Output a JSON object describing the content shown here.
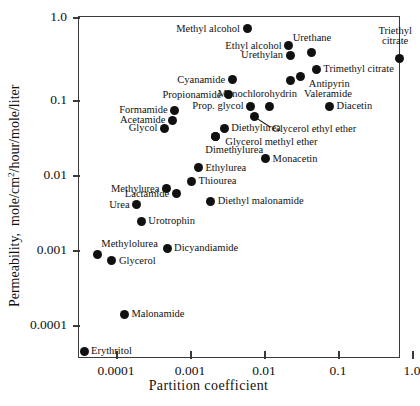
{
  "chart_data": {
    "type": "scatter",
    "title": "",
    "xlabel": "Partition coefficient",
    "ylabel": "Permeability, mole/cm2/hour/mole/liter",
    "ylabel_html": "Permeability,  mole/cm²/hour/mole/liter",
    "xscale": "log",
    "yscale": "log",
    "xlim": [
      3e-05,
      1.0
    ],
    "ylim": [
      4e-05,
      1.0
    ],
    "xticks": [
      "0.0001",
      "0.001",
      "0.01",
      "0.1",
      "1.0"
    ],
    "xtick_values": [
      0.0001,
      0.001,
      0.01,
      0.1,
      1.0
    ],
    "yticks": [
      "1.0",
      "0.1",
      "0.01",
      "0.001",
      "0.0001"
    ],
    "ytick_values": [
      1.0,
      0.1,
      0.01,
      0.001,
      0.0001
    ],
    "grid": false,
    "legend": "none",
    "marker": "filled-circle",
    "marker_color": "#111111",
    "points": [
      {
        "name": "Methyl alcohol",
        "x": 0.0059,
        "y": 0.72,
        "label_side": "left"
      },
      {
        "name": "Ethyl alcohol",
        "x": 0.0215,
        "y": 0.45,
        "label_side": "left"
      },
      {
        "name": "Urethane",
        "x": 0.0445,
        "y": 0.37,
        "label_side": "above"
      },
      {
        "name": "Urethylan",
        "x": 0.0225,
        "y": 0.345,
        "label_side": "left"
      },
      {
        "name": "Triethyl citrate",
        "x": 0.67,
        "y": 0.315,
        "label_side": "above"
      },
      {
        "name": "Trimethyl citrate",
        "x": 0.051,
        "y": 0.235,
        "label_side": "right"
      },
      {
        "name": "Antipyrin",
        "x": 0.0315,
        "y": 0.19,
        "label_side": "below"
      },
      {
        "name": "Valeramide",
        "x": 0.0225,
        "y": 0.172,
        "label_side": "below"
      },
      {
        "name": "Cyanamide",
        "x": 0.0037,
        "y": 0.175,
        "label_side": "left"
      },
      {
        "name": "Propionamide",
        "x": 0.0033,
        "y": 0.115,
        "label_side": "left"
      },
      {
        "name": "Prop. glycol",
        "x": 0.0066,
        "y": 0.083,
        "label_side": "left"
      },
      {
        "name": "Monochlorohydrin",
        "x": 0.0118,
        "y": 0.083,
        "label_side": "above"
      },
      {
        "name": "Diacetin",
        "x": 0.077,
        "y": 0.082,
        "label_side": "right"
      },
      {
        "name": "Formamide",
        "x": 0.00062,
        "y": 0.073,
        "label_side": "left"
      },
      {
        "name": "Acetamide",
        "x": 0.00058,
        "y": 0.054,
        "label_side": "left"
      },
      {
        "name": "Glycerol ethyl ether",
        "x": 0.0074,
        "y": 0.061,
        "label_side": "leader"
      },
      {
        "name": "Glycol",
        "x": 0.00045,
        "y": 0.042,
        "label_side": "left"
      },
      {
        "name": "Diethylurea",
        "x": 0.0029,
        "y": 0.042,
        "label_side": "right"
      },
      {
        "name": "Dimethylurea",
        "x": 0.0022,
        "y": 0.033,
        "label_side": "below"
      },
      {
        "name": "Glycerol methyl ether",
        "x": 0.0022,
        "y": 0.033,
        "label_side": "right"
      },
      {
        "name": "Monacetin",
        "x": 0.0105,
        "y": 0.0165,
        "label_side": "right"
      },
      {
        "name": "Ethylurea",
        "x": 0.0013,
        "y": 0.0125,
        "label_side": "right"
      },
      {
        "name": "Thiourea",
        "x": 0.00105,
        "y": 0.0082,
        "label_side": "right"
      },
      {
        "name": "Methylurea",
        "x": 0.00048,
        "y": 0.0066,
        "label_side": "left"
      },
      {
        "name": "Lactamide",
        "x": 0.00065,
        "y": 0.0056,
        "label_side": "left"
      },
      {
        "name": "Diethyl malonamide",
        "x": 0.0019,
        "y": 0.0045,
        "label_side": "right"
      },
      {
        "name": "Urea",
        "x": 0.00019,
        "y": 0.004,
        "label_side": "left"
      },
      {
        "name": "Urotrophin",
        "x": 0.00022,
        "y": 0.0024,
        "label_side": "right"
      },
      {
        "name": "Dicyandiamide",
        "x": 0.00049,
        "y": 0.00105,
        "label_side": "right"
      },
      {
        "name": "Methylolurea",
        "x": 5.6e-05,
        "y": 0.00086,
        "label_side": "above"
      },
      {
        "name": "Glycerol",
        "x": 8.8e-05,
        "y": 0.00072,
        "label_side": "right"
      },
      {
        "name": "Malonamide",
        "x": 0.00013,
        "y": 0.00014,
        "label_side": "right"
      },
      {
        "name": "Erythritol",
        "x": 3.7e-05,
        "y": 4.5e-05,
        "label_side": "right"
      }
    ]
  }
}
